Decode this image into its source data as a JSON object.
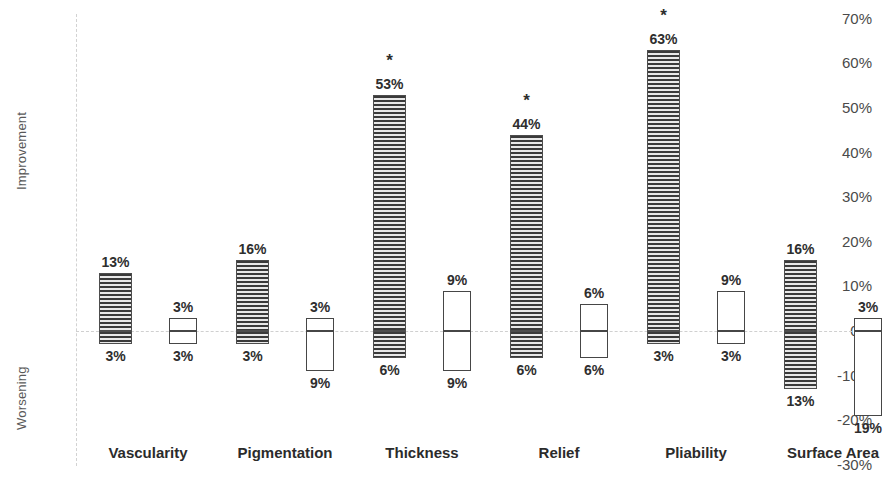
{
  "chart_data": {
    "type": "bar",
    "title": "",
    "subtitle": "",
    "xlabel": "",
    "ylabel_upper": "Improvement",
    "ylabel_lower": "Worsening",
    "ylim": [
      -30,
      70
    ],
    "ytick_labels": [
      "70%",
      "60%",
      "50%",
      "40%",
      "30%",
      "20%",
      "10%",
      "0%",
      "-10%",
      "-20%",
      "-30%"
    ],
    "ytick_values": [
      70,
      60,
      50,
      40,
      30,
      20,
      10,
      0,
      -10,
      -20,
      -30
    ],
    "grid": false,
    "zero_line": true,
    "legend": "none",
    "categories": [
      "Vascularity",
      "Pigmentation",
      "Thickness",
      "Relief",
      "Pliability",
      "Surface Area"
    ],
    "series": [
      {
        "name": "Treated",
        "style": "hatched",
        "improvement_values": [
          13,
          16,
          53,
          44,
          63,
          16
        ],
        "improvement_labels": [
          "13%",
          "16%",
          "53%",
          "44%",
          "63%",
          "16%"
        ],
        "worsening_values": [
          3,
          3,
          6,
          6,
          3,
          13
        ],
        "worsening_labels": [
          "3%",
          "3%",
          "6%",
          "6%",
          "3%",
          "13%"
        ],
        "significance": [
          "",
          "",
          "*",
          "*",
          "*",
          ""
        ]
      },
      {
        "name": "Control",
        "style": "hollow",
        "improvement_values": [
          3,
          3,
          9,
          6,
          9,
          3
        ],
        "improvement_labels": [
          "3%",
          "3%",
          "9%",
          "6%",
          "9%",
          "3%"
        ],
        "worsening_values": [
          3,
          9,
          9,
          6,
          3,
          19
        ],
        "worsening_labels": [
          "3%",
          "9%",
          "9%",
          "6%",
          "3%",
          "19%"
        ],
        "significance": [
          "",
          "",
          "",
          "",
          "",
          ""
        ]
      }
    ]
  },
  "axis": {
    "improvement": "Improvement",
    "worsening": "Worsening"
  },
  "colors": {
    "hatch_dark": "#3a3a3a",
    "hatch_light": "#e8e8e8",
    "bar_border": "#464646",
    "zero_line": "#d0d0d0",
    "axis_line": "#d2d2d2",
    "text": "#2e2e2e",
    "tick_text": "#4a4a4a"
  }
}
